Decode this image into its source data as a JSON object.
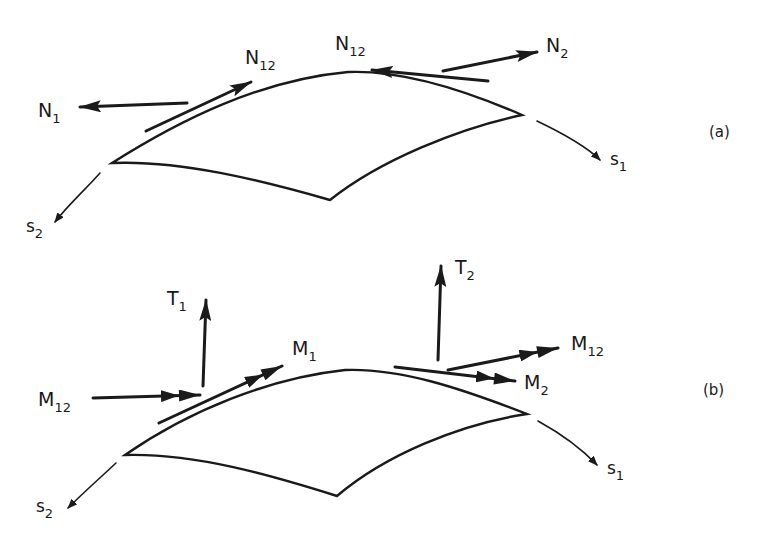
{
  "figure": {
    "panel_a": {
      "label": "(a)",
      "forces": [
        {
          "name": "N",
          "sub": "1"
        },
        {
          "name": "N",
          "sub": "12"
        },
        {
          "name": "N",
          "sub": "12"
        },
        {
          "name": "N",
          "sub": "2"
        }
      ],
      "axes": [
        {
          "name": "s",
          "sub": "1"
        },
        {
          "name": "s",
          "sub": "2"
        }
      ]
    },
    "panel_b": {
      "label": "(b)",
      "forces": [
        {
          "name": "T",
          "sub": "1"
        },
        {
          "name": "T",
          "sub": "2"
        }
      ],
      "moments": [
        {
          "name": "M",
          "sub": "12"
        },
        {
          "name": "M",
          "sub": "1"
        },
        {
          "name": "M",
          "sub": "12"
        },
        {
          "name": "M",
          "sub": "2"
        }
      ],
      "axes": [
        {
          "name": "s",
          "sub": "1"
        },
        {
          "name": "s",
          "sub": "2"
        }
      ]
    }
  }
}
